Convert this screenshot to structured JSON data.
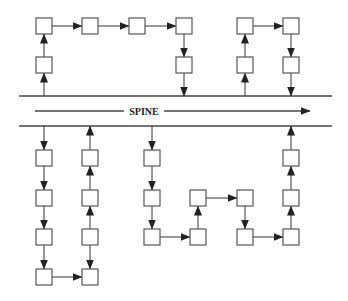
{
  "diagram": {
    "title": "",
    "spine": {
      "label": "SPINE",
      "rail_top_y": 96,
      "rail_bottom_y": 126,
      "rail_x1": 19,
      "rail_x2": 332,
      "arrow_y": 111,
      "arrow_x1": 35,
      "arrow_x2": 310
    },
    "box_size": 16,
    "colors": {
      "stroke": "#555555",
      "arrow": "#222222",
      "fill": "#ffffff"
    },
    "nodes": [
      {
        "id": "t1",
        "x": 44,
        "y": 65
      },
      {
        "id": "t2",
        "x": 44,
        "y": 26
      },
      {
        "id": "t3",
        "x": 90,
        "y": 26
      },
      {
        "id": "t4",
        "x": 137,
        "y": 26
      },
      {
        "id": "t5",
        "x": 184,
        "y": 26
      },
      {
        "id": "t6",
        "x": 184,
        "y": 65
      },
      {
        "id": "t7",
        "x": 245,
        "y": 65
      },
      {
        "id": "t8",
        "x": 245,
        "y": 26
      },
      {
        "id": "t9",
        "x": 291,
        "y": 26
      },
      {
        "id": "t10",
        "x": 291,
        "y": 65
      },
      {
        "id": "b1",
        "x": 44,
        "y": 158
      },
      {
        "id": "b2",
        "x": 44,
        "y": 198
      },
      {
        "id": "b3",
        "x": 44,
        "y": 237
      },
      {
        "id": "b4",
        "x": 44,
        "y": 277
      },
      {
        "id": "b5",
        "x": 90,
        "y": 277
      },
      {
        "id": "b6",
        "x": 90,
        "y": 237
      },
      {
        "id": "b7",
        "x": 90,
        "y": 198
      },
      {
        "id": "b8",
        "x": 90,
        "y": 158
      },
      {
        "id": "b9",
        "x": 152,
        "y": 158
      },
      {
        "id": "b10",
        "x": 152,
        "y": 198
      },
      {
        "id": "b11",
        "x": 152,
        "y": 237
      },
      {
        "id": "b12",
        "x": 198,
        "y": 237
      },
      {
        "id": "b13",
        "x": 198,
        "y": 198
      },
      {
        "id": "b14",
        "x": 245,
        "y": 198
      },
      {
        "id": "b15",
        "x": 245,
        "y": 237
      },
      {
        "id": "b16",
        "x": 291,
        "y": 237
      },
      {
        "id": "b17",
        "x": 291,
        "y": 198
      },
      {
        "id": "b18",
        "x": 291,
        "y": 158
      }
    ],
    "edges": [
      {
        "x1": 44,
        "y1": 96,
        "x2": 44,
        "y2": 73,
        "dir": "up"
      },
      {
        "x1": 44,
        "y1": 57,
        "x2": 44,
        "y2": 34,
        "dir": "up"
      },
      {
        "x1": 52,
        "y1": 26,
        "x2": 82,
        "y2": 26,
        "dir": "right"
      },
      {
        "x1": 98,
        "y1": 26,
        "x2": 129,
        "y2": 26,
        "dir": "right"
      },
      {
        "x1": 145,
        "y1": 26,
        "x2": 176,
        "y2": 26,
        "dir": "right"
      },
      {
        "x1": 184,
        "y1": 34,
        "x2": 184,
        "y2": 57,
        "dir": "down"
      },
      {
        "x1": 184,
        "y1": 73,
        "x2": 184,
        "y2": 96,
        "dir": "down"
      },
      {
        "x1": 245,
        "y1": 96,
        "x2": 245,
        "y2": 73,
        "dir": "up"
      },
      {
        "x1": 245,
        "y1": 57,
        "x2": 245,
        "y2": 34,
        "dir": "up"
      },
      {
        "x1": 253,
        "y1": 26,
        "x2": 283,
        "y2": 26,
        "dir": "right"
      },
      {
        "x1": 291,
        "y1": 34,
        "x2": 291,
        "y2": 57,
        "dir": "down"
      },
      {
        "x1": 291,
        "y1": 73,
        "x2": 291,
        "y2": 96,
        "dir": "down"
      },
      {
        "x1": 44,
        "y1": 126,
        "x2": 44,
        "y2": 150,
        "dir": "down"
      },
      {
        "x1": 44,
        "y1": 166,
        "x2": 44,
        "y2": 190,
        "dir": "down"
      },
      {
        "x1": 44,
        "y1": 206,
        "x2": 44,
        "y2": 229,
        "dir": "down"
      },
      {
        "x1": 44,
        "y1": 245,
        "x2": 44,
        "y2": 269,
        "dir": "down"
      },
      {
        "x1": 52,
        "y1": 277,
        "x2": 82,
        "y2": 277,
        "dir": "right"
      },
      {
        "x1": 90,
        "y1": 245,
        "x2": 90,
        "y2": 269,
        "dir": "down"
      },
      {
        "x1": 90,
        "y1": 229,
        "x2": 90,
        "y2": 206,
        "dir": "up"
      },
      {
        "x1": 90,
        "y1": 190,
        "x2": 90,
        "y2": 166,
        "dir": "up"
      },
      {
        "x1": 90,
        "y1": 150,
        "x2": 90,
        "y2": 126,
        "dir": "up"
      },
      {
        "x1": 152,
        "y1": 126,
        "x2": 152,
        "y2": 150,
        "dir": "down"
      },
      {
        "x1": 152,
        "y1": 166,
        "x2": 152,
        "y2": 190,
        "dir": "down"
      },
      {
        "x1": 152,
        "y1": 206,
        "x2": 152,
        "y2": 229,
        "dir": "down"
      },
      {
        "x1": 160,
        "y1": 237,
        "x2": 190,
        "y2": 237,
        "dir": "right"
      },
      {
        "x1": 198,
        "y1": 229,
        "x2": 198,
        "y2": 206,
        "dir": "up"
      },
      {
        "x1": 206,
        "y1": 198,
        "x2": 237,
        "y2": 198,
        "dir": "right"
      },
      {
        "x1": 245,
        "y1": 206,
        "x2": 245,
        "y2": 229,
        "dir": "down"
      },
      {
        "x1": 253,
        "y1": 237,
        "x2": 283,
        "y2": 237,
        "dir": "right"
      },
      {
        "x1": 291,
        "y1": 229,
        "x2": 291,
        "y2": 206,
        "dir": "up"
      },
      {
        "x1": 291,
        "y1": 190,
        "x2": 291,
        "y2": 166,
        "dir": "up"
      },
      {
        "x1": 291,
        "y1": 150,
        "x2": 291,
        "y2": 126,
        "dir": "up"
      }
    ]
  }
}
